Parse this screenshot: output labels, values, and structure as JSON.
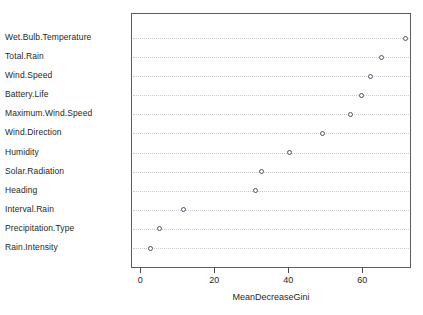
{
  "chart_data": {
    "type": "scatter",
    "title": "",
    "xlabel": "MeanDecreaseGini",
    "ylabel": "",
    "xlim": [
      -2.5,
      73.2
    ],
    "xticks": [
      0,
      20,
      40,
      60
    ],
    "xticklabels": [
      "0",
      "20",
      "40",
      "60"
    ],
    "grid": true,
    "legend": "none",
    "categories": [
      "Wet.Bulb.Temperature",
      "Total.Rain",
      "Wind.Speed",
      "Battery.Life",
      "Maximum.Wind.Speed",
      "Wind.Direction",
      "Humidity",
      "Solar.Radiation",
      "Heading",
      "Interval.Rain",
      "Precipitation.Type",
      "Rain.Intensity"
    ],
    "values": [
      71.5,
      65.0,
      62.0,
      59.5,
      56.5,
      49.0,
      40.0,
      32.5,
      31.0,
      11.5,
      5.0,
      2.5
    ],
    "points": [
      {
        "label": "Wet.Bulb.Temperature",
        "value": 71.5
      },
      {
        "label": "Total.Rain",
        "value": 65.0
      },
      {
        "label": "Wind.Speed",
        "value": 62.0
      },
      {
        "label": "Battery.Life",
        "value": 59.5
      },
      {
        "label": "Maximum.Wind.Speed",
        "value": 56.5
      },
      {
        "label": "Wind.Direction",
        "value": 49.0
      },
      {
        "label": "Humidity",
        "value": 40.0
      },
      {
        "label": "Solar.Radiation",
        "value": 32.5
      },
      {
        "label": "Heading",
        "value": 31.0
      },
      {
        "label": "Interval.Rain",
        "value": 11.5
      },
      {
        "label": "Precipitation.Type",
        "value": 5.0
      },
      {
        "label": "Rain.Intensity",
        "value": 2.5
      }
    ],
    "marker": "open-circle",
    "colors": {
      "marker_stroke": "#52525c",
      "gridline": "#c9c9cf",
      "frame": "#5b5b66",
      "text": "#1f1f1f",
      "background": "#ffffff"
    }
  }
}
